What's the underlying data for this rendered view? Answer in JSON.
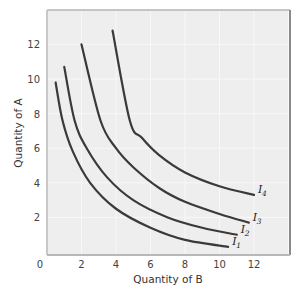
{
  "chart_data": {
    "type": "line",
    "title": "",
    "xlabel": "Quantity of B",
    "ylabel": "Quantity of A",
    "xlim": [
      0,
      14
    ],
    "ylim": [
      0,
      14
    ],
    "xticks": [
      "0",
      "2",
      "4",
      "6",
      "8",
      "10",
      "12"
    ],
    "yticks": [
      "2",
      "4",
      "6",
      "8",
      "10",
      "12"
    ],
    "grid": true,
    "legend": "inline labels at curve ends",
    "series": [
      {
        "name": "I1",
        "label_main": "I",
        "label_sub": "1",
        "points": [
          [
            0.5,
            9.8
          ],
          [
            0.9,
            7.6
          ],
          [
            1.5,
            5.8
          ],
          [
            2.5,
            4.0
          ],
          [
            4.0,
            2.5
          ],
          [
            6.0,
            1.4
          ],
          [
            8.0,
            0.7
          ],
          [
            10.5,
            0.3
          ]
        ]
      },
      {
        "name": "I2",
        "label_main": "I",
        "label_sub": "2",
        "points": [
          [
            1.0,
            10.7
          ],
          [
            1.6,
            7.6
          ],
          [
            2.3,
            6.0
          ],
          [
            3.5,
            4.3
          ],
          [
            5.0,
            3.0
          ],
          [
            7.0,
            2.0
          ],
          [
            9.0,
            1.4
          ],
          [
            11.0,
            1.0
          ]
        ]
      },
      {
        "name": "I3",
        "label_main": "I",
        "label_sub": "3",
        "points": [
          [
            2.0,
            12.0
          ],
          [
            3.1,
            7.6
          ],
          [
            4.0,
            6.0
          ],
          [
            5.0,
            4.9
          ],
          [
            6.5,
            3.7
          ],
          [
            8.0,
            2.9
          ],
          [
            10.0,
            2.2
          ],
          [
            11.7,
            1.7
          ]
        ]
      },
      {
        "name": "I4",
        "label_main": "I",
        "label_sub": "4",
        "points": [
          [
            3.8,
            12.8
          ],
          [
            4.8,
            7.6
          ],
          [
            5.5,
            6.6
          ],
          [
            6.5,
            5.6
          ],
          [
            8.0,
            4.6
          ],
          [
            10.0,
            3.8
          ],
          [
            12.0,
            3.3
          ]
        ]
      }
    ]
  },
  "colors": {
    "plot_background": "#eeeeee",
    "gridline": "#f8f8f8",
    "frame": "#9a9a9a",
    "curve": "#3a3a3a"
  }
}
